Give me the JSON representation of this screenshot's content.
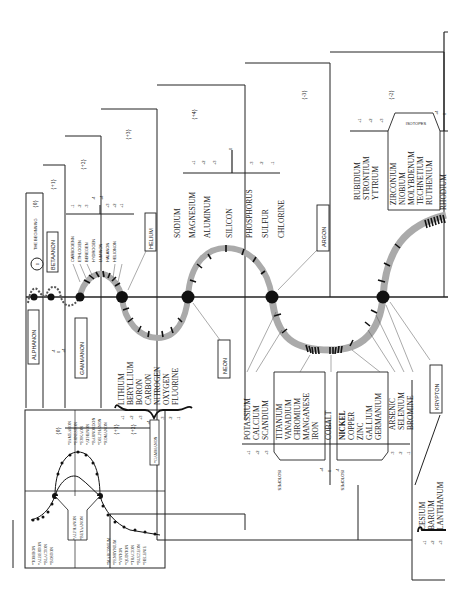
{
  "diagram": {
    "title": "THE BEGINNING",
    "title_group": "{0}",
    "origin_symbol": "0",
    "axis_node_labels": [
      "ALPHANON",
      "BETAANON",
      "GAMMANON",
      "HELIUM",
      "NEON",
      "ARGON",
      "KRYPTON"
    ],
    "groups": {
      "g0": "{0}",
      "g_plus1": "{+1}",
      "g_plus2": "{+2}",
      "g_plus3": "{+3}",
      "g_plus4": "{+4}",
      "g_minus3": "{-3}",
      "g_minus2": "{-2}"
    },
    "octave2_elements": {
      "names": [
        "CARBOGENN",
        "ETHLOGEN",
        "BEREGEN",
        "HYDROGEN",
        "LUMINON",
        "HALANON",
        "HELIONON"
      ],
      "valences": [
        "-1",
        "-2",
        "-3",
        "-4",
        "+4",
        "+3",
        "+2",
        "+1"
      ]
    },
    "octave3_elements": {
      "names": [
        "LITHIUM",
        "BERYLLIUM",
        "BORON",
        "CARBON",
        "NITROGEN",
        "OXYGEN",
        "FLUORINE"
      ],
      "valences": [
        "+1",
        "+2",
        "+3",
        "+4",
        "-4",
        "-3",
        "-2",
        "-1"
      ]
    },
    "octave4_elements": {
      "names": [
        "SODIUM",
        "MAGNESIUM",
        "ALUMINUM",
        "SILICON",
        "PHOSPHORUS",
        "SULFUR",
        "CHLORINE"
      ],
      "valences": [
        "+1",
        "+2",
        "+3",
        "0",
        "-3",
        "-2",
        "-1"
      ]
    },
    "octave5_elements": {
      "left": [
        "POTASSIUM",
        "CALCIUM",
        "SCANDIUM"
      ],
      "left_valences": [
        "+1",
        "+2",
        "+3"
      ],
      "isotopes_a": [
        "TITANIUM",
        "VANADIUM",
        "CHROMIUM",
        "MANGANESE",
        "IRON"
      ],
      "center": "COBALT",
      "center_valences": [
        "+4",
        "0",
        "-4"
      ],
      "isotopes_b": [
        "NICKEL",
        "COPPER",
        "ZINC",
        "GALLIUM",
        "GERMANIUM"
      ],
      "right": [
        "ARSENIC",
        "SELENIUM",
        "BROMINE"
      ],
      "right_valences": [
        "-3",
        "-2",
        "-1"
      ],
      "isotopes_label": "ISOTOPES"
    },
    "octave6_elements": {
      "left": [
        "RUBIDIUM",
        "STRONTIUM",
        "YTTRIUM"
      ],
      "left_valences": [
        "+1",
        "+2",
        "+3"
      ],
      "isotopes": [
        "ZIRCONIUM",
        "NIOBIUM",
        "MOLYBDENUM",
        "TECHNETIUM",
        "RUTHENIUM"
      ],
      "isotopes_label": "ISOTOPES",
      "center": "RHODIUM",
      "center_valences": [
        "+4",
        "0"
      ]
    },
    "octave7_elements": {
      "names": [
        "CESIUM",
        "BARIUM",
        "LANTHANUM"
      ],
      "valences": [
        "+1",
        "+2",
        "+3"
      ]
    },
    "alphanon_valences": [
      "-4",
      "0",
      "+4"
    ],
    "inset": {
      "group0": "{0}",
      "group_plus1": "{+1}",
      "group_plus2": "{+2}",
      "upper_left": [
        "*TOMBON",
        "*ALBERTON",
        "*BLACTON",
        "*BOSTON"
      ],
      "upper_right": [
        "*JAMEARON",
        "*ERNESTON",
        "*EYKAON",
        "*ATHENON",
        "*BARNORDON",
        "*DELPHANON",
        "*ROMANON"
      ],
      "lower_left": [
        "*MARCONIUM",
        "*PENRYNIUM",
        "*VINTON",
        "*QUINTON",
        "*TRACION",
        "*BUZZEON",
        "*HELENIE"
      ],
      "box_labels": [
        "*ALPHANON",
        "*BETAANON"
      ],
      "gammanon_label": "*GAMMANON"
    }
  }
}
